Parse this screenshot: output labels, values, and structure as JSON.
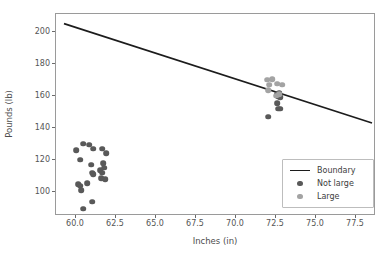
{
  "chart_data": {
    "type": "scatter",
    "title": "",
    "xlabel": "Inches (in)",
    "ylabel": "Pounds (lb)",
    "xlim": [
      58.75,
      78.75
    ],
    "ylim": [
      85.0,
      211.0
    ],
    "xticks": [
      "60.0",
      "62.5",
      "65.0",
      "67.5",
      "70.0",
      "72.5",
      "75.0",
      "77.5"
    ],
    "xtick_values": [
      60.0,
      62.5,
      65.0,
      67.5,
      70.0,
      72.5,
      75.0,
      77.5
    ],
    "yticks": [
      "100",
      "120",
      "140",
      "160",
      "180",
      "200"
    ],
    "ytick_values": [
      100,
      120,
      140,
      160,
      180,
      200
    ],
    "grid": false,
    "legend_position": "lower right",
    "series": [
      {
        "name": "Not large",
        "color": "#595959",
        "marker": "circle",
        "points": [
          [
            60.0,
            126.0
          ],
          [
            60.44,
            130.0
          ],
          [
            60.81,
            129.5
          ],
          [
            61.06,
            127.0
          ],
          [
            61.62,
            127.0
          ],
          [
            60.25,
            120.0
          ],
          [
            61.88,
            124.0
          ],
          [
            60.94,
            117.0
          ],
          [
            61.69,
            118.0
          ],
          [
            61.75,
            115.0
          ],
          [
            61.0,
            112.0
          ],
          [
            61.06,
            111.0
          ],
          [
            61.5,
            113.5
          ],
          [
            61.62,
            112.0
          ],
          [
            61.56,
            108.5
          ],
          [
            61.81,
            108.0
          ],
          [
            60.12,
            105.0
          ],
          [
            60.25,
            104.0
          ],
          [
            60.69,
            105.5
          ],
          [
            60.31,
            101.0
          ],
          [
            61.0,
            94.0
          ],
          [
            60.44,
            89.5
          ],
          [
            72.0,
            147.0
          ],
          [
            72.62,
            152.0
          ],
          [
            72.75,
            152.0
          ],
          [
            72.56,
            155.5
          ],
          [
            72.62,
            159.5
          ],
          [
            72.75,
            159.0
          ],
          [
            72.56,
            161.0
          ],
          [
            72.69,
            161.5
          ]
        ]
      },
      {
        "name": "Large",
        "color": "#a3a3a3",
        "marker": "circle",
        "points": [
          [
            71.94,
            170.0
          ],
          [
            72.25,
            170.5
          ],
          [
            72.06,
            167.0
          ],
          [
            72.56,
            167.5
          ],
          [
            72.88,
            167.0
          ],
          [
            72.0,
            163.5
          ],
          [
            72.69,
            161.0
          ],
          [
            72.5,
            160.0
          ]
        ]
      }
    ],
    "boundary": {
      "name": "Boundary",
      "color": "#1c1c1c",
      "x": [
        59.25,
        78.5
      ],
      "y": [
        205.0,
        143.0
      ]
    }
  },
  "legend": {
    "items": [
      {
        "label": "Boundary",
        "key": "line"
      },
      {
        "label": "Not large",
        "key": "dot-dark"
      },
      {
        "label": "Large",
        "key": "dot-light"
      }
    ]
  }
}
